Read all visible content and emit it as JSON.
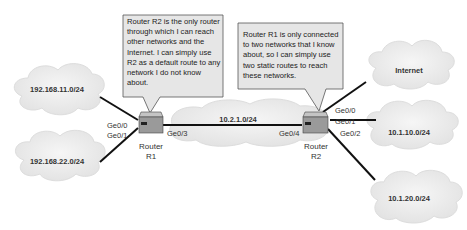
{
  "callouts": [
    {
      "id": "r1-thought",
      "text": "Router R2 is the only router through which I can reach other networks and the Internet. I can simply use R2 as a default route to any network I do not know about.",
      "points_to": "R1"
    },
    {
      "id": "r2-thought",
      "text": "Router R1 is only connected to two networks that I know about, so I can simply use two static routes to reach these networks.",
      "points_to": "R2"
    }
  ],
  "routers": [
    {
      "name": "R1",
      "label_line1": "Router",
      "label_line2": "R1"
    },
    {
      "name": "R2",
      "label_line1": "Router",
      "label_line2": "R2"
    }
  ],
  "networks": {
    "lan1": "192.168.11.0/24",
    "lan2": "192.168.22.0/24",
    "transit": "10.2.1.0/24",
    "internet": "Internet",
    "lan3": "10.1.10.0/24",
    "lan4": "10.1.20.0/24"
  },
  "ports": {
    "r1_ge00": "Ge0/0",
    "r1_ge01": "Ge0/1",
    "r1_ge03": "Ge0/3",
    "r2_ge04": "Ge0/4",
    "r2_ge00": "Ge0/0",
    "r2_ge01": "Ge0/1",
    "r2_ge02": "Ge0/2"
  },
  "colors": {
    "cloud_fill": "#eeeeee",
    "cloud_edge": "#dcdcdc",
    "callout_fill": "#e6e6e6",
    "callout_border": "#555555",
    "router_body": "#9a9a9a",
    "router_top": "#c4c4c4",
    "link": "#111111"
  }
}
